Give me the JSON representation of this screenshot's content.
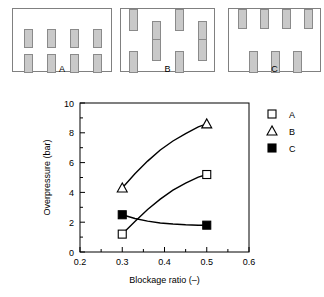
{
  "configurations": {
    "items": [
      {
        "label": "A",
        "description": "free-standing obstacles, two rows of four",
        "blocks": [
          {
            "x": 11,
            "y": 20,
            "w": 9,
            "h": 19
          },
          {
            "x": 34,
            "y": 20,
            "w": 9,
            "h": 19
          },
          {
            "x": 57,
            "y": 20,
            "w": 9,
            "h": 19
          },
          {
            "x": 80,
            "y": 20,
            "w": 9,
            "h": 19
          },
          {
            "x": 11,
            "y": 45,
            "w": 9,
            "h": 19
          },
          {
            "x": 34,
            "y": 45,
            "w": 9,
            "h": 19
          },
          {
            "x": 57,
            "y": 45,
            "w": 9,
            "h": 19
          },
          {
            "x": 80,
            "y": 45,
            "w": 9,
            "h": 19
          }
        ]
      },
      {
        "label": "B",
        "description": "staggered obstacles, some attached to walls",
        "blocks": [
          {
            "x": 8,
            "y": 0,
            "w": 9,
            "h": 22
          },
          {
            "x": 31,
            "y": 12,
            "w": 9,
            "h": 22
          },
          {
            "x": 54,
            "y": 0,
            "w": 9,
            "h": 22
          },
          {
            "x": 77,
            "y": 12,
            "w": 9,
            "h": 22
          },
          {
            "x": 8,
            "y": 42,
            "w": 9,
            "h": 22
          },
          {
            "x": 31,
            "y": 30,
            "w": 9,
            "h": 22
          },
          {
            "x": 54,
            "y": 42,
            "w": 9,
            "h": 22
          },
          {
            "x": 77,
            "y": 30,
            "w": 9,
            "h": 22
          }
        ]
      },
      {
        "label": "C",
        "description": "obstacles attached to top and bottom walls",
        "blocks": [
          {
            "x": 9,
            "y": 0,
            "w": 9,
            "h": 20
          },
          {
            "x": 31,
            "y": 0,
            "w": 9,
            "h": 20
          },
          {
            "x": 53,
            "y": 0,
            "w": 9,
            "h": 20
          },
          {
            "x": 75,
            "y": 0,
            "w": 9,
            "h": 20
          },
          {
            "x": 20,
            "y": 42,
            "w": 9,
            "h": 22
          },
          {
            "x": 42,
            "y": 42,
            "w": 9,
            "h": 22
          },
          {
            "x": 64,
            "y": 42,
            "w": 9,
            "h": 22
          }
        ]
      }
    ]
  },
  "chart_data": {
    "type": "line",
    "title": "",
    "xlabel": "Blockage ratio (–)",
    "ylabel": "Overpressure (bar)",
    "xlim": [
      0.2,
      0.6
    ],
    "ylim": [
      0,
      10
    ],
    "xticks": [
      0.2,
      0.3,
      0.4,
      0.5,
      0.6
    ],
    "xticklabels": [
      "0.2",
      "0.3",
      "0.4",
      "0.5",
      "0.6"
    ],
    "xminorticks": [
      0.25,
      0.35,
      0.45,
      0.55
    ],
    "yticks": [
      0,
      2,
      4,
      6,
      8,
      10
    ],
    "yticklabels": [
      "0",
      "2",
      "4",
      "6",
      "8",
      "10"
    ],
    "yminorticks": [
      1,
      3,
      5,
      7,
      9
    ],
    "grid": false,
    "legend_position": "right",
    "x": [
      0.3,
      0.5
    ],
    "series": [
      {
        "name": "A",
        "marker": "open-square",
        "values": [
          1.2,
          5.2
        ],
        "curve": [
          {
            "x": 0.3,
            "y": 1.2
          },
          {
            "x": 0.33,
            "y": 2.05
          },
          {
            "x": 0.36,
            "y": 2.85
          },
          {
            "x": 0.39,
            "y": 3.55
          },
          {
            "x": 0.42,
            "y": 4.15
          },
          {
            "x": 0.45,
            "y": 4.62
          },
          {
            "x": 0.48,
            "y": 5.02
          },
          {
            "x": 0.5,
            "y": 5.2
          }
        ]
      },
      {
        "name": "B",
        "marker": "open-triangle",
        "values": [
          4.3,
          8.6
        ],
        "curve": [
          {
            "x": 0.3,
            "y": 4.3
          },
          {
            "x": 0.33,
            "y": 5.25
          },
          {
            "x": 0.36,
            "y": 6.1
          },
          {
            "x": 0.39,
            "y": 6.85
          },
          {
            "x": 0.42,
            "y": 7.45
          },
          {
            "x": 0.45,
            "y": 7.95
          },
          {
            "x": 0.48,
            "y": 8.4
          },
          {
            "x": 0.5,
            "y": 8.6
          }
        ]
      },
      {
        "name": "C",
        "marker": "filled-square",
        "values": [
          2.5,
          1.8
        ],
        "curve": [
          {
            "x": 0.3,
            "y": 2.5
          },
          {
            "x": 0.33,
            "y": 2.25
          },
          {
            "x": 0.36,
            "y": 2.07
          },
          {
            "x": 0.39,
            "y": 1.95
          },
          {
            "x": 0.42,
            "y": 1.88
          },
          {
            "x": 0.45,
            "y": 1.83
          },
          {
            "x": 0.48,
            "y": 1.8
          },
          {
            "x": 0.5,
            "y": 1.8
          }
        ]
      }
    ],
    "legend": [
      {
        "label": "A",
        "marker": "open-square"
      },
      {
        "label": "B",
        "marker": "open-triangle"
      },
      {
        "label": "C",
        "marker": "filled-square"
      }
    ]
  }
}
